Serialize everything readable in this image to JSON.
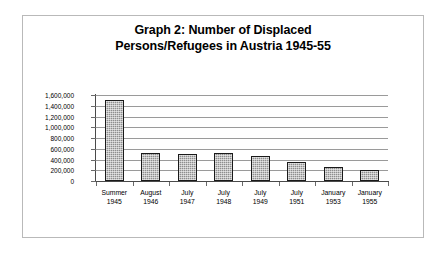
{
  "figure": {
    "title_line1": "Graph 2: Number of Displaced",
    "title_line2": "Persons/Refugees in Austria 1945-55"
  },
  "chart_data": {
    "type": "bar",
    "title": "Graph 2: Number of Displaced Persons/Refugees in Austria 1945-55",
    "xlabel": "",
    "ylabel": "",
    "categories": [
      "Summer 1945",
      "August 1946",
      "July 1947",
      "July 1948",
      "July 1949",
      "July 1951",
      "January 1953",
      "January 1955"
    ],
    "category_lines": [
      [
        "Summer",
        "1945"
      ],
      [
        "August",
        "1946"
      ],
      [
        "July",
        "1947"
      ],
      [
        "July",
        "1948"
      ],
      [
        "July",
        "1949"
      ],
      [
        "July",
        "1951"
      ],
      [
        "January",
        "1953"
      ],
      [
        "January",
        "1955"
      ]
    ],
    "values": [
      1500000,
      520000,
      510000,
      520000,
      460000,
      360000,
      260000,
      210000
    ],
    "ylim": [
      0,
      1600000
    ],
    "ytick_values": [
      1600000,
      1400000,
      1200000,
      1000000,
      800000,
      600000,
      400000,
      200000,
      0
    ],
    "ytick_labels": [
      "1,600,000",
      "1,400,000",
      "1,200,000",
      "1,000,000",
      "800,000",
      "600,000",
      "400,000",
      "200,000",
      "0"
    ],
    "grid": true,
    "legend": null,
    "bar_color": "#8e8e8e",
    "bar_border_color": "#1a1a1a",
    "gridline_color": "#9a9a9a",
    "axis_color": "#4a4a4a",
    "background_color": "#ffffff",
    "frame_color": "#b9b9b9"
  }
}
